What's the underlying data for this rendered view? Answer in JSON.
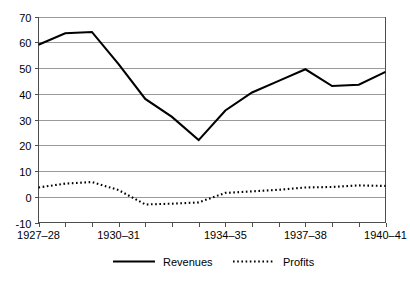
{
  "chart_data": {
    "type": "line",
    "title": "",
    "subtitle": "",
    "xlabel": "",
    "ylabel": "",
    "grid": true,
    "legend_position": "bottom",
    "ylim": [
      -10,
      70
    ],
    "yticks": [
      -10,
      0,
      10,
      20,
      30,
      40,
      50,
      60,
      70
    ],
    "ytick_labels": [
      "-10",
      "0",
      "10",
      "20",
      "30",
      "40",
      "50",
      "60",
      "70"
    ],
    "categories": [
      "1927-28",
      "1928-29",
      "1929-30",
      "1930-31",
      "1931-32",
      "1932-33",
      "1933-34",
      "1934-35",
      "1935-36",
      "1936-37",
      "1937-38",
      "1938-39",
      "1939-40",
      "1940-41"
    ],
    "xtick_labels": [
      "1927-28",
      "1930-31",
      "1934-35",
      "1937-38",
      "1940-41"
    ],
    "xtick_label_positions": [
      0,
      3,
      7,
      10,
      13
    ],
    "series": [
      {
        "name": "Revenues",
        "style": "solid",
        "color": "#000000",
        "values": [
          59,
          63.5,
          64,
          51.5,
          38,
          31,
          22,
          33.5,
          40.5,
          45,
          49.5,
          43,
          43.5,
          48.5
        ]
      },
      {
        "name": "Profits",
        "style": "dotted",
        "color": "#000000",
        "values": [
          3.6,
          5.1,
          5.7,
          2.6,
          -3,
          -2.7,
          -2.2,
          1.5,
          2.1,
          2.7,
          3.6,
          3.8,
          4.4,
          4.2
        ]
      }
    ]
  },
  "legend": {
    "items": [
      {
        "label": "Revenues",
        "style": "solid"
      },
      {
        "label": "Profits",
        "style": "dotted"
      }
    ]
  }
}
